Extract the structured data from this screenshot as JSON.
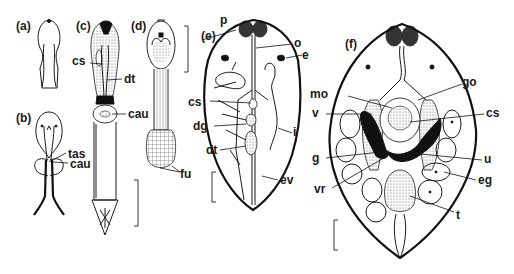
{
  "figure": {
    "panels": [
      {
        "id": "a",
        "label": "(a)",
        "labels": []
      },
      {
        "id": "b",
        "label": "(b)",
        "labels": [
          "tas",
          "cau"
        ]
      },
      {
        "id": "c",
        "label": "(c)",
        "labels": [
          "cs",
          "dt",
          "cau"
        ]
      },
      {
        "id": "d",
        "label": "(d)",
        "labels": [
          "fu"
        ]
      },
      {
        "id": "e",
        "label": "(e)",
        "labels": [
          "p",
          "o",
          "e",
          "cs",
          "i",
          "dg",
          "dt",
          "ev"
        ]
      },
      {
        "id": "f",
        "label": "(f)",
        "labels": [
          "go",
          "mo",
          "v",
          "cs",
          "g",
          "u",
          "eg",
          "vr",
          "t"
        ]
      }
    ]
  },
  "labels": {
    "a": "(a)",
    "b": "(b)",
    "c": "(c)",
    "d": "(d)",
    "e": "(e)",
    "f": "(f)",
    "b_tas": "tas",
    "b_cau": "cau",
    "c_cs": "cs",
    "c_dt": "dt",
    "c_cau": "cau",
    "d_fu": "fu",
    "e_p": "p",
    "e_o": "o",
    "e_e": "e",
    "e_cs": "cs",
    "e_i": "i",
    "e_dg": "dg",
    "e_dt": "dt",
    "e_ev": "ev",
    "f_go": "go",
    "f_mo": "mo",
    "f_v": "v",
    "f_cs": "cs",
    "f_g": "g",
    "f_u": "u",
    "f_eg": "eg",
    "f_vr": "vr",
    "f_t": "t"
  }
}
